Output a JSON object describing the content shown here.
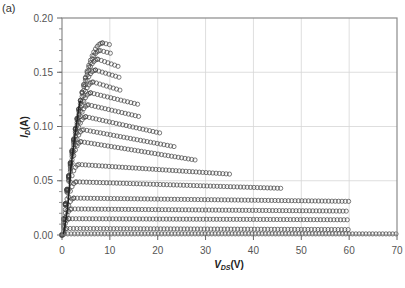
{
  "panel_label": "(a)",
  "chart_data": {
    "type": "scatter",
    "title": "",
    "panel_label": "(a)",
    "xlabel": "V_DS(V)",
    "ylabel": "I_D(A)",
    "xlim": [
      0,
      70
    ],
    "ylim": [
      0,
      0.2
    ],
    "x_ticks": [
      0,
      10,
      20,
      30,
      40,
      50,
      60,
      70
    ],
    "x_tick_labels": [
      "0",
      "10",
      "20",
      "30",
      "40",
      "50",
      "60",
      "70"
    ],
    "y_ticks": [
      0.0,
      0.05,
      0.1,
      0.15,
      0.2
    ],
    "y_tick_labels": [
      "0.00",
      "0.05",
      "0.10",
      "0.15",
      "0.20"
    ],
    "grid": true,
    "legend": null,
    "marker": "open-circle",
    "series": [
      {
        "name": "curve-1",
        "peak_v": 8.5,
        "peak_i": 0.177,
        "end_v": 10.4,
        "end_i": 0.175
      },
      {
        "name": "curve-2",
        "peak_v": 8.0,
        "peak_i": 0.17,
        "end_v": 10.6,
        "end_i": 0.167
      },
      {
        "name": "curve-3",
        "peak_v": 7.5,
        "peak_i": 0.162,
        "end_v": 12.0,
        "end_i": 0.155
      },
      {
        "name": "curve-4",
        "peak_v": 7.0,
        "peak_i": 0.152,
        "end_v": 12.2,
        "end_i": 0.145
      },
      {
        "name": "curve-5",
        "peak_v": 6.5,
        "peak_i": 0.141,
        "end_v": 12.5,
        "end_i": 0.133
      },
      {
        "name": "curve-6",
        "peak_v": 6.0,
        "peak_i": 0.131,
        "end_v": 16.3,
        "end_i": 0.12
      },
      {
        "name": "curve-7",
        "peak_v": 5.5,
        "peak_i": 0.12,
        "end_v": 16.3,
        "end_i": 0.109
      },
      {
        "name": "curve-8",
        "peak_v": 5.0,
        "peak_i": 0.109,
        "end_v": 20.5,
        "end_i": 0.094
      },
      {
        "name": "curve-9",
        "peak_v": 4.5,
        "peak_i": 0.097,
        "end_v": 24.0,
        "end_i": 0.081
      },
      {
        "name": "curve-10",
        "peak_v": 4.0,
        "peak_i": 0.086,
        "end_v": 28.0,
        "end_i": 0.069
      },
      {
        "name": "curve-11",
        "peak_v": 3.5,
        "peak_i": 0.065,
        "end_v": 35.5,
        "end_i": 0.056
      },
      {
        "name": "curve-12",
        "peak_v": 3.0,
        "peak_i": 0.049,
        "end_v": 46.0,
        "end_i": 0.043
      },
      {
        "name": "curve-13",
        "peak_v": 2.5,
        "peak_i": 0.034,
        "end_v": 60.0,
        "end_i": 0.031
      },
      {
        "name": "curve-14",
        "peak_v": 2.0,
        "peak_i": 0.024,
        "end_v": 60.0,
        "end_i": 0.022
      },
      {
        "name": "curve-15",
        "peak_v": 1.5,
        "peak_i": 0.015,
        "end_v": 60.0,
        "end_i": 0.014
      },
      {
        "name": "curve-16",
        "peak_v": 1.0,
        "peak_i": 0.006,
        "end_v": 60.0,
        "end_i": 0.005
      },
      {
        "name": "curve-17",
        "peak_v": 0.5,
        "peak_i": 0.001,
        "end_v": 70.0,
        "end_i": 0.001
      }
    ]
  }
}
